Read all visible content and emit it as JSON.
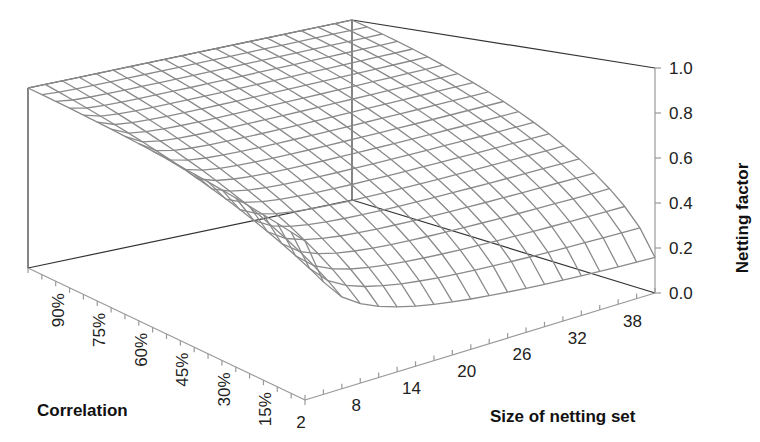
{
  "chart_data": {
    "type": "surface",
    "title": "",
    "zlabel": "Netting factor",
    "xlabel": "Size of netting set",
    "ylabel": "Correlation",
    "z_ticks": [
      "0.0",
      "0.2",
      "0.4",
      "0.6",
      "0.8",
      "1.0"
    ],
    "zlim": [
      0,
      1
    ],
    "x_ticks": [
      "2",
      "8",
      "14",
      "20",
      "26",
      "32",
      "38"
    ],
    "x_range": [
      2,
      40
    ],
    "y_ticks": [
      "15%",
      "30%",
      "45%",
      "60%",
      "75%",
      "90%"
    ],
    "y_range": [
      0,
      100
    ],
    "surface_formula": "sqrt((1 + rho*(n-1))/n)",
    "grid": {
      "n_values": [
        2,
        4,
        6,
        8,
        10,
        12,
        14,
        16,
        18,
        20,
        22,
        24,
        26,
        28,
        30,
        32,
        34,
        36,
        38,
        40
      ],
      "rho_values": [
        0,
        5,
        10,
        15,
        20,
        25,
        30,
        35,
        40,
        45,
        50,
        55,
        60,
        65,
        70,
        75,
        80,
        85,
        90,
        95,
        100
      ]
    },
    "sample_points": [
      {
        "n": 2,
        "rho": 0,
        "z": 0.71
      },
      {
        "n": 40,
        "rho": 0,
        "z": 0.16
      },
      {
        "n": 2,
        "rho": 100,
        "z": 1.0
      },
      {
        "n": 40,
        "rho": 100,
        "z": 1.0
      },
      {
        "n": 20,
        "rho": 50,
        "z": 0.72
      }
    ]
  }
}
